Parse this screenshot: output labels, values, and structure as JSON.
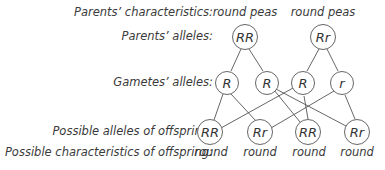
{
  "row_labels": {
    "parents_characteristics": "Parents’ characteristics:",
    "parents_alleles": "Parents’ alleles:",
    "gametes_alleles": "Gametes’ alleles:",
    "offspring_alleles": "Possible alleles of offspring:",
    "offspring_characteristics": "Possible characteristics of offspring:"
  },
  "parents": [
    {
      "characteristic": "round peas",
      "alleles": "RR"
    },
    {
      "characteristic": "round peas",
      "alleles": "Rr"
    }
  ],
  "gametes": [
    "R",
    "R",
    "R",
    "r"
  ],
  "offspring": [
    {
      "alleles": "RR",
      "characteristic": "round"
    },
    {
      "alleles": "Rr",
      "characteristic": "round"
    },
    {
      "alleles": "RR",
      "characteristic": "round"
    },
    {
      "alleles": "Rr",
      "characteristic": "round"
    }
  ]
}
